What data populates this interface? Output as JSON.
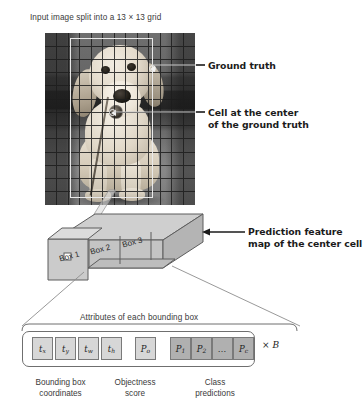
{
  "figure": {
    "title": "Input image split into a 13 × 13 grid",
    "grid": {
      "cols": 13,
      "rows": 13,
      "label": "13 × 13"
    }
  },
  "callouts": [
    {
      "id": "ground-truth",
      "text": "Ground truth"
    },
    {
      "id": "cell-center",
      "line1": "Cell at the center",
      "line2": "of the ground truth"
    },
    {
      "id": "prediction-feature-map",
      "line1": "Prediction feature",
      "line2": "map of the center cell"
    }
  ],
  "feature_map": {
    "boxes": [
      {
        "label": "Box 1"
      },
      {
        "label": "Box 2"
      },
      {
        "label": "Box 3"
      }
    ]
  },
  "attributes": {
    "caption": "Attributes of each bounding box",
    "multiplier": "× B",
    "multiplier_symbol": "×",
    "multiplier_var": "B",
    "cells": [
      {
        "sym": "t",
        "sub": "x",
        "group": "bbox",
        "shade": "light"
      },
      {
        "sym": "t",
        "sub": "y",
        "group": "bbox",
        "shade": "light"
      },
      {
        "sym": "t",
        "sub": "w",
        "group": "bbox",
        "shade": "light"
      },
      {
        "sym": "t",
        "sub": "h",
        "group": "bbox",
        "shade": "light"
      },
      {
        "sym": "P",
        "sub": "o",
        "group": "objectness",
        "shade": "light"
      },
      {
        "sym": "P",
        "sub": "1",
        "group": "class",
        "shade": "dark"
      },
      {
        "sym": "P",
        "sub": "2",
        "group": "class",
        "shade": "dark"
      },
      {
        "sym": "…",
        "sub": "",
        "group": "class",
        "shade": "dark",
        "dots": true
      },
      {
        "sym": "P",
        "sub": "c",
        "group": "class",
        "shade": "dark"
      }
    ],
    "groups": [
      {
        "id": "bbox",
        "line1": "Bounding box",
        "line2": "coordinates"
      },
      {
        "id": "objectness",
        "line1": "Objectness",
        "line2": "score"
      },
      {
        "id": "class",
        "line1": "Class",
        "line2": "predictions"
      }
    ]
  },
  "colors": {
    "cell_light": "#d7d7d7",
    "cell_dark": "#b0b0b0",
    "stroke": "#6f6f6f",
    "text": "#231f20",
    "callout_text": "#1b1b1b",
    "ground_truth_box": "#e9e9e9"
  }
}
